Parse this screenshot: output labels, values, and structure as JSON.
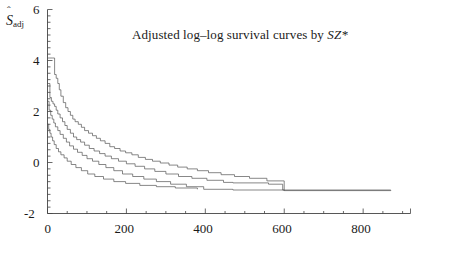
{
  "chart_data": {
    "type": "line",
    "title": "Adjusted log–log survival curves by SZ*",
    "title_plain": "Adjusted log-log survival curves by SZ*",
    "title_italic_part": "SZ*",
    "xlabel": "Days",
    "ylabel": "Ŝadj",
    "ylabel_base": "S",
    "ylabel_sub": "adj",
    "ylabel_accent": "ˆ",
    "xlim": [
      0,
      920
    ],
    "ylim": [
      -2,
      6
    ],
    "xticks": [
      0,
      200,
      400,
      600,
      800
    ],
    "xticklabels": [
      "0",
      "200",
      "400",
      "600",
      "800"
    ],
    "xminor_step": 50,
    "yticks": [
      -2,
      0,
      2,
      4,
      6
    ],
    "yticklabels": [
      "-2",
      "0",
      "2",
      "4",
      "6"
    ],
    "yminor_step": 0.25,
    "grid": false,
    "legend": "none",
    "step_mode": "post",
    "line_color": "#555555",
    "line_width": 0.7,
    "series": [
      {
        "name": "curve-1",
        "x": [
          2,
          12,
          18,
          22,
          26,
          30,
          34,
          40,
          46,
          52,
          58,
          64,
          70,
          78,
          86,
          94,
          104,
          114,
          124,
          134,
          146,
          158,
          170,
          184,
          198,
          214,
          230,
          248,
          266,
          286,
          308,
          330,
          354,
          380,
          408,
          440,
          474,
          512,
          556,
          600,
          870
        ],
        "y": [
          4.1,
          4.1,
          3.45,
          3.3,
          3.1,
          2.85,
          2.6,
          2.35,
          2.15,
          2.0,
          1.85,
          1.7,
          1.6,
          1.5,
          1.38,
          1.25,
          1.15,
          1.05,
          0.95,
          0.85,
          0.75,
          0.62,
          0.55,
          0.45,
          0.38,
          0.3,
          0.2,
          0.12,
          0.05,
          -0.02,
          -0.1,
          -0.18,
          -0.25,
          -0.32,
          -0.4,
          -0.48,
          -0.55,
          -0.62,
          -0.72,
          -1.1,
          -1.1
        ]
      },
      {
        "name": "curve-2",
        "x": [
          1,
          6,
          10,
          14,
          18,
          22,
          26,
          32,
          38,
          44,
          50,
          58,
          66,
          74,
          84,
          94,
          106,
          118,
          132,
          146,
          162,
          180,
          200,
          222,
          246,
          272,
          300,
          332,
          366,
          404,
          446,
          470,
          560,
          596,
          870
        ],
        "y": [
          3.1,
          2.55,
          2.4,
          2.3,
          2.2,
          2.05,
          1.9,
          1.75,
          1.6,
          1.45,
          1.3,
          1.15,
          1.0,
          0.9,
          0.8,
          0.68,
          0.55,
          0.45,
          0.35,
          0.25,
          0.15,
          0.05,
          -0.05,
          -0.15,
          -0.25,
          -0.35,
          -0.45,
          -0.55,
          -0.62,
          -0.7,
          -0.78,
          -0.8,
          -0.85,
          -1.08,
          -1.1
        ]
      },
      {
        "name": "curve-3",
        "x": [
          1,
          4,
          8,
          12,
          16,
          20,
          26,
          32,
          40,
          48,
          56,
          66,
          76,
          88,
          100,
          114,
          130,
          148,
          168,
          190,
          216,
          244,
          276,
          312,
          352,
          396,
          470,
          600
        ],
        "y": [
          2.4,
          2.05,
          1.85,
          1.7,
          1.55,
          1.4,
          1.25,
          1.1,
          0.95,
          0.8,
          0.65,
          0.52,
          0.4,
          0.28,
          0.15,
          0.05,
          -0.08,
          -0.2,
          -0.32,
          -0.45,
          -0.55,
          -0.65,
          -0.75,
          -0.85,
          -0.95,
          -1.05,
          -1.08,
          -1.1
        ]
      },
      {
        "name": "curve-4",
        "x": [
          1,
          3,
          6,
          9,
          13,
          17,
          22,
          28,
          34,
          42,
          50,
          60,
          72,
          86,
          102,
          120,
          142,
          168,
          198,
          234,
          276,
          324,
          380
        ],
        "y": [
          1.5,
          1.3,
          1.15,
          1.0,
          0.85,
          0.7,
          0.55,
          0.42,
          0.3,
          0.18,
          0.05,
          -0.08,
          -0.2,
          -0.32,
          -0.45,
          -0.55,
          -0.65,
          -0.75,
          -0.82,
          -0.9,
          -0.95,
          -1.0,
          -1.05
        ]
      }
    ]
  },
  "axes": {
    "x_axis_name": "days-axis",
    "y_axis_name": "survival-axis"
  }
}
